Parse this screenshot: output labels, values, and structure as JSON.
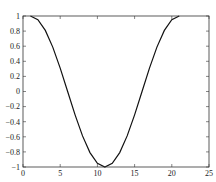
{
  "chart_data": {
    "type": "line",
    "title": "",
    "xlabel": "",
    "ylabel": "",
    "xlim": [
      0,
      25
    ],
    "ylim": [
      -1,
      1
    ],
    "grid": false,
    "legend": null,
    "x_ticks": [
      0,
      5,
      10,
      15,
      20,
      25
    ],
    "x_tick_labels": [
      "0",
      "5",
      "10",
      "15",
      "20",
      "25"
    ],
    "y_ticks": [
      1,
      0.8,
      0.6,
      0.4,
      0.2,
      0,
      -0.2,
      -0.4,
      -0.6,
      -0.8,
      -1
    ],
    "y_tick_labels": [
      "1",
      "0.8",
      "0.6",
      "0.4",
      "0.2",
      "0",
      "−0.2",
      "−0.4",
      "−0.6",
      "−0.8",
      "−1"
    ],
    "series": [
      {
        "name": "cosine",
        "color": "#111111",
        "x": [
          1,
          2,
          3,
          4,
          5,
          6,
          7,
          8,
          9,
          10,
          11,
          12,
          13,
          14,
          15,
          16,
          17,
          18,
          19,
          20,
          21
        ],
        "y": [
          1.0,
          0.951,
          0.809,
          0.588,
          0.309,
          0.0,
          -0.309,
          -0.588,
          -0.809,
          -0.951,
          -1.0,
          -0.951,
          -0.809,
          -0.588,
          -0.309,
          0.0,
          0.309,
          0.588,
          0.809,
          0.951,
          1.0
        ]
      }
    ]
  }
}
